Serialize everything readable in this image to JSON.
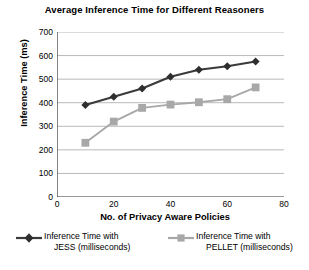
{
  "chart_data": {
    "type": "line",
    "title": "Average Inference Time for Different Reasoners",
    "xlabel": "No. of Privacy Aware Policies",
    "ylabel": "Inference Time (ms)",
    "x": [
      10,
      20,
      30,
      40,
      50,
      60,
      70
    ],
    "xlim": [
      0,
      80
    ],
    "ylim": [
      0,
      700
    ],
    "xticks": [
      0,
      20,
      40,
      60,
      80
    ],
    "yticks": [
      0,
      100,
      200,
      300,
      400,
      500,
      600,
      700
    ],
    "grid": "horizontal",
    "legend_position": "bottom",
    "series": [
      {
        "name": "Inference Time with JESS (milliseconds)",
        "name_line1": "Inference Time with",
        "name_line2": "JESS (milliseconds)",
        "marker": "diamond",
        "color": "#3a3a3a",
        "values": [
          390,
          425,
          460,
          510,
          540,
          555,
          575
        ]
      },
      {
        "name": "Inference Time with PELLET (milliseconds)",
        "name_line1": "Inference Time with",
        "name_line2": "PELLET (milliseconds)",
        "marker": "square",
        "color": "#a8a8a8",
        "values": [
          230,
          320,
          378,
          392,
          402,
          415,
          465
        ]
      }
    ]
  },
  "axis": {
    "y_ticks_labels": [
      "700",
      "600",
      "500",
      "400",
      "300",
      "200",
      "100",
      "0"
    ],
    "x_ticks_labels": [
      "0",
      "20",
      "40",
      "60",
      "80"
    ]
  }
}
